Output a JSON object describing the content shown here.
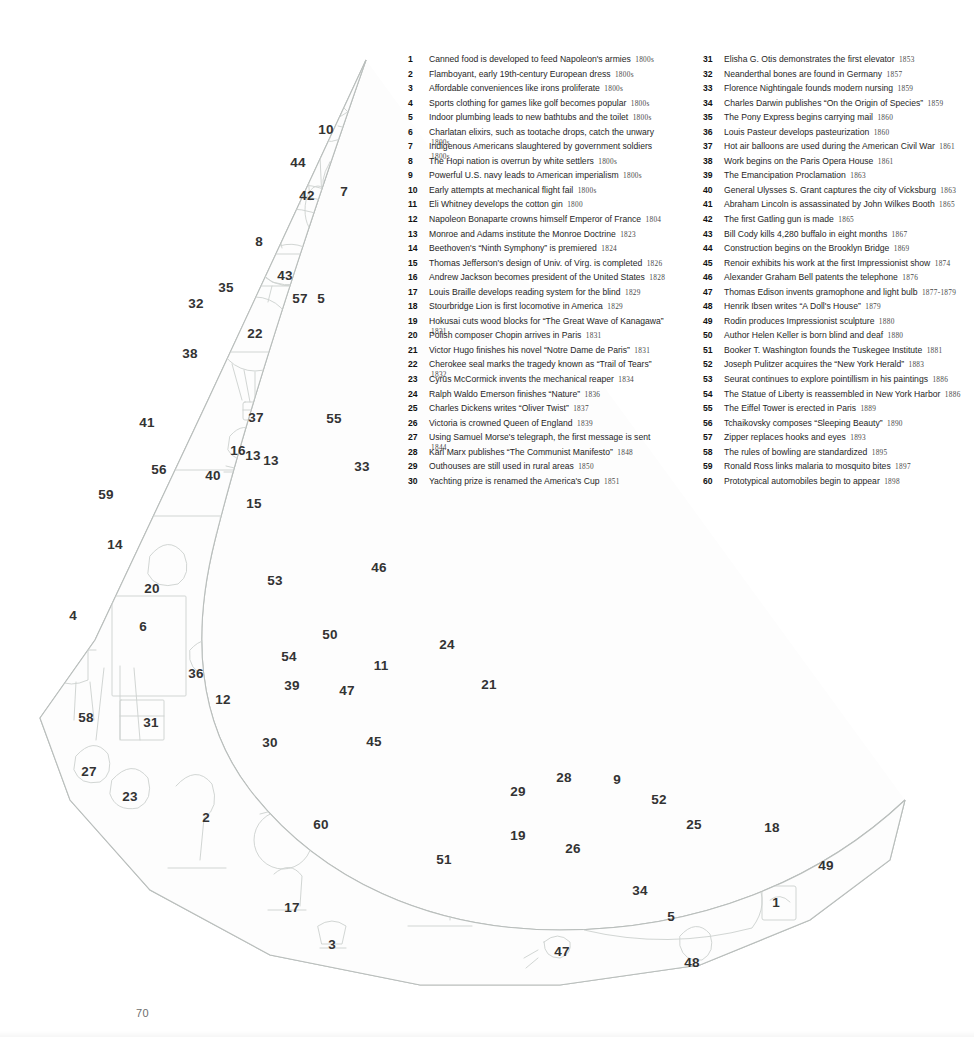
{
  "page": {
    "number": "70",
    "background_color": "#ffffff",
    "line_art_color": "#c9cdcb",
    "callout_color": "#333333"
  },
  "illustration": {
    "name": "crescent-moon-shaped-19th-century-collage",
    "description": "Crescent / waning-moon outline filled with line-drawn 19th-century figures and objects, each tagged with a numbered callout keyed to the legend.",
    "callouts": [
      {
        "n": "10",
        "x": 326,
        "y": 130
      },
      {
        "n": "44",
        "x": 298,
        "y": 163
      },
      {
        "n": "42",
        "x": 307,
        "y": 196
      },
      {
        "n": "7",
        "x": 344,
        "y": 192
      },
      {
        "n": "8",
        "x": 259,
        "y": 242
      },
      {
        "n": "43",
        "x": 285,
        "y": 276
      },
      {
        "n": "35",
        "x": 226,
        "y": 288
      },
      {
        "n": "57",
        "x": 300,
        "y": 299
      },
      {
        "n": "5",
        "x": 321,
        "y": 299
      },
      {
        "n": "32",
        "x": 196,
        "y": 304
      },
      {
        "n": "22",
        "x": 255,
        "y": 334
      },
      {
        "n": "38",
        "x": 190,
        "y": 354
      },
      {
        "n": "37",
        "x": 256,
        "y": 418
      },
      {
        "n": "55",
        "x": 334,
        "y": 419
      },
      {
        "n": "41",
        "x": 147,
        "y": 423
      },
      {
        "n": "16",
        "x": 238,
        "y": 451
      },
      {
        "n": "13",
        "x": 253,
        "y": 456
      },
      {
        "n": "13",
        "x": 271,
        "y": 461
      },
      {
        "n": "33",
        "x": 362,
        "y": 467
      },
      {
        "n": "56",
        "x": 159,
        "y": 470
      },
      {
        "n": "40",
        "x": 213,
        "y": 476
      },
      {
        "n": "15",
        "x": 254,
        "y": 504
      },
      {
        "n": "59",
        "x": 106,
        "y": 495
      },
      {
        "n": "14",
        "x": 115,
        "y": 545
      },
      {
        "n": "20",
        "x": 152,
        "y": 589
      },
      {
        "n": "46",
        "x": 379,
        "y": 568
      },
      {
        "n": "53",
        "x": 275,
        "y": 581
      },
      {
        "n": "4",
        "x": 73,
        "y": 616
      },
      {
        "n": "6",
        "x": 143,
        "y": 627
      },
      {
        "n": "50",
        "x": 330,
        "y": 635
      },
      {
        "n": "24",
        "x": 447,
        "y": 645
      },
      {
        "n": "54",
        "x": 289,
        "y": 657
      },
      {
        "n": "11",
        "x": 381,
        "y": 666
      },
      {
        "n": "36",
        "x": 196,
        "y": 674
      },
      {
        "n": "39",
        "x": 292,
        "y": 686
      },
      {
        "n": "47",
        "x": 347,
        "y": 691
      },
      {
        "n": "21",
        "x": 489,
        "y": 685
      },
      {
        "n": "12",
        "x": 223,
        "y": 700
      },
      {
        "n": "58",
        "x": 86,
        "y": 718
      },
      {
        "n": "31",
        "x": 151,
        "y": 723
      },
      {
        "n": "30",
        "x": 270,
        "y": 743
      },
      {
        "n": "45",
        "x": 374,
        "y": 742
      },
      {
        "n": "27",
        "x": 89,
        "y": 772
      },
      {
        "n": "23",
        "x": 130,
        "y": 797
      },
      {
        "n": "28",
        "x": 564,
        "y": 778
      },
      {
        "n": "9",
        "x": 617,
        "y": 780
      },
      {
        "n": "52",
        "x": 659,
        "y": 800
      },
      {
        "n": "29",
        "x": 518,
        "y": 792
      },
      {
        "n": "25",
        "x": 694,
        "y": 825
      },
      {
        "n": "18",
        "x": 772,
        "y": 828
      },
      {
        "n": "2",
        "x": 206,
        "y": 818
      },
      {
        "n": "60",
        "x": 321,
        "y": 825
      },
      {
        "n": "19",
        "x": 518,
        "y": 836
      },
      {
        "n": "26",
        "x": 573,
        "y": 849
      },
      {
        "n": "49",
        "x": 826,
        "y": 866
      },
      {
        "n": "51",
        "x": 444,
        "y": 860
      },
      {
        "n": "34",
        "x": 640,
        "y": 891
      },
      {
        "n": "17",
        "x": 292,
        "y": 908
      },
      {
        "n": "5",
        "x": 671,
        "y": 917
      },
      {
        "n": "1",
        "x": 776,
        "y": 903
      },
      {
        "n": "3",
        "x": 332,
        "y": 945
      },
      {
        "n": "47",
        "x": 562,
        "y": 952
      },
      {
        "n": "48",
        "x": 692,
        "y": 963
      }
    ]
  },
  "legend": {
    "columns": [
      {
        "name": "legend-column-left",
        "entries": [
          {
            "n": "1",
            "text": "Canned food is developed to feed Napoleon's armies",
            "year": "1800s"
          },
          {
            "n": "2",
            "text": "Flamboyant, early 19th-century European dress",
            "year": "1800s"
          },
          {
            "n": "3",
            "text": "Affordable conveniences like irons proliferate",
            "year": "1800s"
          },
          {
            "n": "4",
            "text": "Sports clothing for games like golf becomes popular",
            "year": "1800s"
          },
          {
            "n": "5",
            "text": "Indoor plumbing leads to new bathtubs and the toilet",
            "year": "1800s"
          },
          {
            "n": "6",
            "text": "Charlatan elixirs, such as tootache drops, catch the unwary",
            "year": "1800s"
          },
          {
            "n": "7",
            "text": "Indigenous Americans slaughtered by government soldiers",
            "year": "1800s"
          },
          {
            "n": "8",
            "text": "The Hopi nation is overrun by white settlers",
            "year": "1800s"
          },
          {
            "n": "9",
            "text": "Powerful U.S. navy leads to American imperialism",
            "year": "1800s"
          },
          {
            "n": "10",
            "text": "Early attempts at mechanical flight fail",
            "year": "1800s"
          },
          {
            "n": "11",
            "text": "Eli Whitney develops the cotton gin",
            "year": "1800"
          },
          {
            "n": "12",
            "text": "Napoleon Bonaparte crowns himself Emperor of France",
            "year": "1804"
          },
          {
            "n": "13",
            "text": "Monroe and Adams institute the Monroe Doctrine",
            "year": "1823"
          },
          {
            "n": "14",
            "text": "Beethoven's “Ninth Symphony” is premiered",
            "year": "1824"
          },
          {
            "n": "15",
            "text": "Thomas Jefferson's design of Univ. of Virg. is completed",
            "year": "1826"
          },
          {
            "n": "16",
            "text": "Andrew Jackson becomes president of the United States",
            "year": "1828"
          },
          {
            "n": "17",
            "text": "Louis Braille develops reading system for the blind",
            "year": "1829"
          },
          {
            "n": "18",
            "text": "Stourbridge Lion is first locomotive in America",
            "year": "1829"
          },
          {
            "n": "19",
            "text": "Hokusai cuts wood blocks for “The Great Wave of Kanagawa”",
            "year": "1831"
          },
          {
            "n": "20",
            "text": "Polish composer Chopin arrives in Paris",
            "year": "1831"
          },
          {
            "n": "21",
            "text": "Victor Hugo finishes his novel “Notre Dame de Paris”",
            "year": "1831"
          },
          {
            "n": "22",
            "text": "Cherokee seal marks the tragedy known as “Trail of Tears”",
            "year": "1832"
          },
          {
            "n": "23",
            "text": "Cyrus McCormick invents the mechanical reaper",
            "year": "1834"
          },
          {
            "n": "24",
            "text": "Ralph Waldo Emerson finishes “Nature”",
            "year": "1836"
          },
          {
            "n": "25",
            "text": "Charles Dickens writes “Oliver Twist”",
            "year": "1837"
          },
          {
            "n": "26",
            "text": "Victoria is crowned Queen of England",
            "year": "1839"
          },
          {
            "n": "27",
            "text": "Using Samuel Morse's telegraph, the first message is sent",
            "year": "1844"
          },
          {
            "n": "28",
            "text": "Karl Marx publishes “The Communist Manifesto”",
            "year": "1848"
          },
          {
            "n": "29",
            "text": "Outhouses are still used in rural areas",
            "year": "1850"
          },
          {
            "n": "30",
            "text": "Yachting prize is renamed the America's Cup",
            "year": "1851"
          }
        ]
      },
      {
        "name": "legend-column-right",
        "entries": [
          {
            "n": "31",
            "text": "Elisha G. Otis demonstrates the first elevator",
            "year": "1853"
          },
          {
            "n": "32",
            "text": "Neanderthal bones are found in Germany",
            "year": "1857"
          },
          {
            "n": "33",
            "text": "Florence Nightingale founds modern nursing",
            "year": "1859"
          },
          {
            "n": "34",
            "text": "Charles Darwin publishes “On the Origin of Species”",
            "year": "1859"
          },
          {
            "n": "35",
            "text": "The Pony Express begins carrying mail",
            "year": "1860"
          },
          {
            "n": "36",
            "text": "Louis Pasteur develops pasteurization",
            "year": "1860"
          },
          {
            "n": "37",
            "text": "Hot air balloons are used during the American Civil War",
            "year": "1861"
          },
          {
            "n": "38",
            "text": "Work begins on the Paris Opera House",
            "year": "1861"
          },
          {
            "n": "39",
            "text": "The Emancipation Proclamation",
            "year": "1863"
          },
          {
            "n": "40",
            "text": "General Ulysses S. Grant captures the city of Vicksburg",
            "year": "1863"
          },
          {
            "n": "41",
            "text": "Abraham Lincoln is assassinated by John Wilkes Booth",
            "year": "1865"
          },
          {
            "n": "42",
            "text": "The first Gatling gun is made",
            "year": "1865"
          },
          {
            "n": "43",
            "text": "Bill Cody kills 4,280 buffalo in eight months",
            "year": "1867"
          },
          {
            "n": "44",
            "text": "Construction begins on the Brooklyn Bridge",
            "year": "1869"
          },
          {
            "n": "45",
            "text": "Renoir exhibits his work at the first Impressionist show",
            "year": "1874"
          },
          {
            "n": "46",
            "text": "Alexander Graham Bell patents the telephone",
            "year": "1876"
          },
          {
            "n": "47",
            "text": "Thomas Edison invents gramophone and light bulb",
            "year": "1877-1879"
          },
          {
            "n": "48",
            "text": "Henrik Ibsen writes “A Doll's House”",
            "year": "1879"
          },
          {
            "n": "49",
            "text": "Rodin produces Impressionist sculpture",
            "year": "1880"
          },
          {
            "n": "50",
            "text": "Author Helen Keller is born blind and deaf",
            "year": "1880"
          },
          {
            "n": "51",
            "text": "Booker T. Washington founds the Tuskegee Institute",
            "year": "1881"
          },
          {
            "n": "52",
            "text": "Joseph Pulitzer acquires the “New York Herald”",
            "year": "1883"
          },
          {
            "n": "53",
            "text": "Seurat continues to explore pointillism in his paintings",
            "year": "1886"
          },
          {
            "n": "54",
            "text": "The Statue of Liberty is reassembled in New York Harbor",
            "year": "1886"
          },
          {
            "n": "55",
            "text": "The Eiffel Tower is erected in Paris",
            "year": "1889"
          },
          {
            "n": "56",
            "text": "Tchaikovsky composes “Sleeping Beauty”",
            "year": "1890"
          },
          {
            "n": "57",
            "text": "Zipper replaces hooks and eyes",
            "year": "1893"
          },
          {
            "n": "58",
            "text": "The rules of bowling are standardized",
            "year": "1895"
          },
          {
            "n": "59",
            "text": "Ronald Ross links malaria to mosquito bites",
            "year": "1897"
          },
          {
            "n": "60",
            "text": "Prototypical automobiles begin to appear",
            "year": "1898"
          }
        ]
      }
    ]
  }
}
